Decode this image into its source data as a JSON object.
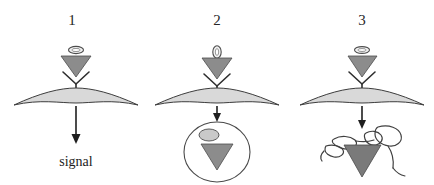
{
  "figure": {
    "caption_present": false,
    "background_color": "#ffffff",
    "panel_count": 3
  },
  "panels": [
    {
      "number": "1",
      "ligand_icon": "ligand-ring-icon",
      "receptor_icon": "y-receptor-icon",
      "carrier_icon": "triangle-carrier-icon",
      "membrane_icon": "curved-membrane-icon",
      "arrow_icon": "down-arrow-icon",
      "outcome_label": "signal"
    },
    {
      "number": "2",
      "ligand_icon": "ligand-ring-icon",
      "ligand_mark": "0",
      "receptor_icon": "y-receptor-icon",
      "carrier_icon": "triangle-carrier-icon",
      "membrane_icon": "curved-membrane-icon",
      "arrow_icon": "down-arrow-icon",
      "vesicle_icon": "endosome-circle-icon",
      "vesicle_cargo_icon": "triangle-carrier-icon",
      "vesicle_ligand_icon": "ligand-filled-icon"
    },
    {
      "number": "3",
      "ligand_icon": "ligand-ring-icon",
      "receptor_icon": "y-receptor-icon",
      "carrier_icon": "triangle-carrier-icon",
      "membrane_icon": "curved-membrane-icon",
      "arrow_icon": "down-arrow-icon",
      "degradation_icon": "lysosome-blob-icon",
      "degradation_cargo_icon": "triangle-carrier-icon"
    }
  ],
  "colors": {
    "membrane_fill": "#d9d9d9",
    "membrane_stroke": "#3d3d3d",
    "triangle_fill": "#8c8c8c",
    "outline": "#333333",
    "text": "#1c1c1c"
  }
}
